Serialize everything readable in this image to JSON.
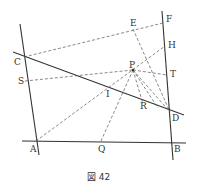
{
  "figure": {
    "caption": "図 42",
    "points": {
      "A": {
        "label": "A",
        "x": 36,
        "y": 141
      },
      "B": {
        "label": "B",
        "x": 172,
        "y": 143
      },
      "C": {
        "label": "C",
        "x": 24,
        "y": 56
      },
      "D": {
        "label": "D",
        "x": 170,
        "y": 112
      },
      "E": {
        "label": "E",
        "x": 133,
        "y": 28
      },
      "F": {
        "label": "F",
        "x": 163,
        "y": 23
      },
      "H": {
        "label": "H",
        "x": 165,
        "y": 46
      },
      "P": {
        "label": "P",
        "x": 133,
        "y": 71
      },
      "T": {
        "label": "T",
        "x": 167,
        "y": 74
      },
      "S": {
        "label": "S",
        "x": 27,
        "y": 81
      },
      "I": {
        "label": "I",
        "x": 107,
        "y": 96
      },
      "R": {
        "label": "R",
        "x": 143,
        "y": 104
      },
      "Q": {
        "label": "Q",
        "x": 101,
        "y": 141
      }
    }
  }
}
